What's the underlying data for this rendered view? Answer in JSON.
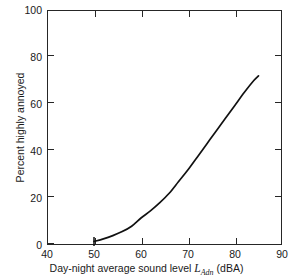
{
  "figure": {
    "background_color": "#ffffff",
    "frame_color": "#262626",
    "curve_color": "#111111"
  },
  "axes": {
    "x": {
      "title_text": "Day-night average sound level",
      "title_symbol": "L",
      "title_subscript": "Adn",
      "title_unit": "(dBA)",
      "ticks": [
        {
          "value": 40,
          "label": "40"
        },
        {
          "value": 50,
          "label": "50"
        },
        {
          "value": 60,
          "label": "60"
        },
        {
          "value": 70,
          "label": "70"
        },
        {
          "value": 80,
          "label": "80"
        },
        {
          "value": 90,
          "label": "90"
        }
      ]
    },
    "y": {
      "title": "Percent highly annoyed",
      "ticks": [
        {
          "value": 0,
          "label": "0"
        },
        {
          "value": 20,
          "label": "20"
        },
        {
          "value": 40,
          "label": "40"
        },
        {
          "value": 60,
          "label": "60"
        },
        {
          "value": 80,
          "label": "80"
        },
        {
          "value": 100,
          "label": "100"
        }
      ]
    }
  },
  "chart_data": {
    "type": "line",
    "title": "",
    "subtitle": "",
    "xlabel": "Day-night average sound level L_Adn (dBA)",
    "ylabel": "Percent highly annoyed",
    "xlim": [
      40,
      90
    ],
    "ylim": [
      0,
      100
    ],
    "grid": false,
    "legend": null,
    "xticks": [
      40,
      50,
      60,
      70,
      80,
      90
    ],
    "yticks": [
      0,
      20,
      40,
      60,
      80,
      100
    ],
    "tick_direction": "in",
    "ticks_on_sides": [
      "left",
      "bottom",
      "right",
      "top"
    ],
    "series": [
      {
        "name": "Percent highly annoyed",
        "x": [
          50,
          52,
          54,
          56,
          58,
          60,
          62,
          64,
          66,
          68,
          70,
          72,
          74,
          76,
          78,
          80,
          82,
          84,
          85
        ],
        "y": [
          1.5,
          2.6,
          4.0,
          5.7,
          8.0,
          11.5,
          14.5,
          18.0,
          22.0,
          27.0,
          32.0,
          37.5,
          43.0,
          48.5,
          54.0,
          59.5,
          65.0,
          70.0,
          72.0
        ],
        "marker_at_start": {
          "x": 50,
          "y": 1.5,
          "style": "short-vertical-tick"
        }
      }
    ],
    "annotations": []
  }
}
